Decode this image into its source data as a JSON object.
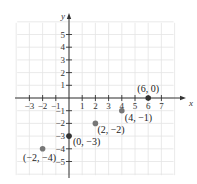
{
  "chart_data": {
    "type": "scatter",
    "title": "",
    "xlabel": "x",
    "ylabel": "y",
    "xlim": [
      -4,
      8
    ],
    "ylim": [
      -6,
      6
    ],
    "grid": true,
    "x_ticks": [
      -3,
      -2,
      -1,
      1,
      2,
      3,
      4,
      5,
      6,
      7
    ],
    "y_ticks": [
      -5,
      -4,
      -3,
      -2,
      -1,
      1,
      2,
      3,
      4,
      5
    ],
    "points": [
      {
        "x": 6,
        "y": 0,
        "label": "(6, 0)",
        "color": "#333333"
      },
      {
        "x": 4,
        "y": -1,
        "label": "(4, −1)",
        "color": "#777777"
      },
      {
        "x": 2,
        "y": -2,
        "label": "(2, −2)",
        "color": "#777777"
      },
      {
        "x": 0,
        "y": -3,
        "label": "(0, −3)",
        "color": "#333333"
      },
      {
        "x": -2,
        "y": -4,
        "label": "(−2, −4)",
        "color": "#777777"
      }
    ]
  },
  "colors": {
    "grid": "#e4e4e4",
    "axis": "#333333"
  }
}
